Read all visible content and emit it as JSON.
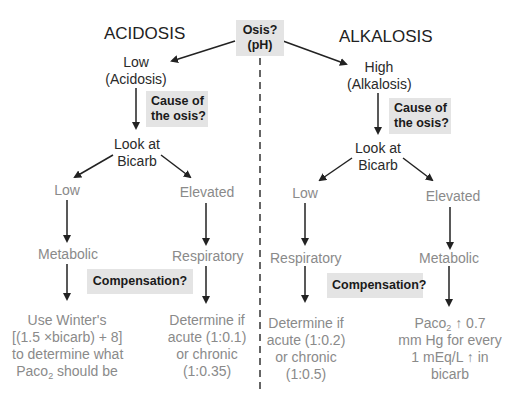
{
  "titles": {
    "left": "ACIDOSIS",
    "right": "ALKALOSIS"
  },
  "root": {
    "line1": "Osis?",
    "line2": "(pH)"
  },
  "prompts": {
    "cause_line1": "Cause of",
    "cause_line2": "the osis?",
    "compensation": "Compensation?"
  },
  "acidosis": {
    "ph": {
      "line1": "Low",
      "line2": "(Acidosis)"
    },
    "look": {
      "line1": "Look at",
      "line2": "Bicarb"
    },
    "low_branch": {
      "label": "Low",
      "type": "Metabolic",
      "rule": [
        "Use Winter's",
        "[(1.5 ×bicarb) + 8]",
        "to determine what",
        "should be"
      ],
      "rule_var": "Paco",
      "rule_sub": "2"
    },
    "high_branch": {
      "label": "Elevated",
      "type": "Respiratory",
      "rule": [
        "Determine if",
        "acute (1:0.1)",
        "or chronic",
        "(1:0.35)"
      ]
    }
  },
  "alkalosis": {
    "ph": {
      "line1": "High",
      "line2": "(Alkalosis)"
    },
    "look": {
      "line1": "Look at",
      "line2": "Bicarb"
    },
    "low_branch": {
      "label": "Low",
      "type": "Respiratory",
      "rule": [
        "Determine if",
        "acute (1:0.2)",
        "or chronic",
        "(1:0.5)"
      ]
    },
    "high_branch": {
      "label": "Elevated",
      "type": "Metabolic",
      "rule": [
        "↑ 0.7",
        "mm Hg for every",
        "1 mEq/L ↑ in",
        "bicarb"
      ],
      "rule_var": "Paco",
      "rule_sub": "2"
    }
  }
}
